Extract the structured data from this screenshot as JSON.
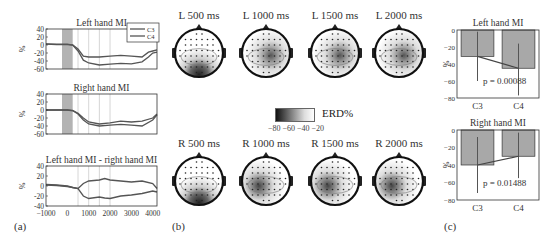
{
  "panel_labels": {
    "a": "(a)",
    "b": "(b)",
    "c": "(c)"
  },
  "colors": {
    "axis": "#333333",
    "line": "#555555",
    "bar": "#a8a8a8",
    "shade": "#9a9a9a",
    "grid": "#cccccc"
  },
  "chart_data": [
    {
      "id": "a1",
      "type": "line",
      "title": "Left hand MI",
      "xlabel": "",
      "ylabel": "%",
      "xlim": [
        -1000,
        4200
      ],
      "ylim": [
        -60,
        40
      ],
      "yticks": [
        40,
        20,
        0,
        -20,
        -40,
        -60
      ],
      "xticks": [
        -1000,
        0,
        1000,
        2000,
        3000,
        4000
      ],
      "shaded_region": [
        -250,
        250
      ],
      "vlines": [
        500,
        1000,
        1500,
        2000
      ],
      "legend": [
        "C3",
        "C4"
      ],
      "legend_position": "upper right",
      "series": [
        {
          "name": "C3",
          "x": [
            -1000,
            -500,
            0,
            250,
            500,
            750,
            1000,
            1500,
            2000,
            2500,
            3000,
            3500,
            3800,
            4000,
            4200
          ],
          "values": [
            2,
            1,
            1,
            0,
            -10,
            -28,
            -30,
            -30,
            -28,
            -26,
            -28,
            -30,
            -18,
            -15,
            -12
          ]
        },
        {
          "name": "C4",
          "x": [
            -1000,
            -500,
            0,
            250,
            500,
            750,
            1000,
            1500,
            2000,
            2500,
            3000,
            3500,
            3800,
            4000,
            4200
          ],
          "values": [
            3,
            2,
            2,
            0,
            -15,
            -38,
            -45,
            -50,
            -48,
            -46,
            -47,
            -42,
            -30,
            -20,
            -18
          ]
        }
      ]
    },
    {
      "id": "a2",
      "type": "line",
      "title": "Right hand MI",
      "xlabel": "",
      "ylabel": "%",
      "xlim": [
        -1000,
        4200
      ],
      "ylim": [
        -60,
        40
      ],
      "yticks": [
        40,
        20,
        0,
        -20,
        -40,
        -60
      ],
      "shaded_region": [
        -250,
        250
      ],
      "vlines": [
        500,
        1000,
        1500,
        2000
      ],
      "series": [
        {
          "name": "C3",
          "x": [
            -1000,
            -500,
            0,
            250,
            500,
            750,
            1000,
            1500,
            2000,
            2500,
            3000,
            3500,
            4000,
            4200
          ],
          "values": [
            0,
            0,
            0,
            -2,
            -10,
            -25,
            -35,
            -40,
            -38,
            -36,
            -38,
            -40,
            -25,
            -12
          ]
        },
        {
          "name": "C4",
          "x": [
            -1000,
            -500,
            0,
            250,
            500,
            750,
            1000,
            1500,
            2000,
            2500,
            3000,
            3500,
            4000,
            4200
          ],
          "values": [
            0,
            0,
            0,
            -1,
            -8,
            -20,
            -30,
            -35,
            -32,
            -28,
            -30,
            -28,
            -20,
            -10
          ]
        }
      ]
    },
    {
      "id": "a3",
      "type": "line",
      "title": "Left hand MI - right hand MI",
      "xlabel": "",
      "ylabel": "%",
      "xlim": [
        -1000,
        4200
      ],
      "ylim": [
        -40,
        40
      ],
      "yticks": [
        40,
        20,
        0,
        -20,
        -40
      ],
      "xticks": [
        -1000,
        0,
        1000,
        2000,
        3000,
        4000
      ],
      "vlines": [
        500,
        1000,
        1500,
        2000
      ],
      "series": [
        {
          "name": "C3",
          "x": [
            -1000,
            -500,
            0,
            250,
            500,
            750,
            1000,
            1500,
            1750,
            2000,
            2500,
            3000,
            3500,
            4000,
            4200
          ],
          "values": [
            3,
            2,
            0,
            -3,
            -5,
            5,
            10,
            12,
            15,
            12,
            10,
            8,
            10,
            5,
            -5
          ]
        },
        {
          "name": "C4",
          "x": [
            -1000,
            -500,
            0,
            250,
            500,
            750,
            1000,
            1500,
            1750,
            2000,
            2500,
            3000,
            3500,
            4000,
            4200
          ],
          "values": [
            2,
            1,
            -1,
            -3,
            -5,
            -20,
            -25,
            -22,
            -24,
            -25,
            -20,
            -18,
            -15,
            -10,
            -12
          ]
        }
      ]
    },
    {
      "id": "c1",
      "type": "bar",
      "title": "Left hand MI",
      "ylabel": "%",
      "categories": [
        "C3",
        "C4"
      ],
      "values": [
        -31,
        -45
      ],
      "error_low": [
        -60,
        -77
      ],
      "error_high": [
        -2,
        -16
      ],
      "ylim": [
        -80,
        0
      ],
      "yticks": [
        0,
        -20,
        -40,
        -60,
        -80
      ],
      "annotation": "p = 0.00088"
    },
    {
      "id": "c2",
      "type": "bar",
      "title": "Right hand MI",
      "ylabel": "%",
      "categories": [
        "C3",
        "C4"
      ],
      "values": [
        -40,
        -30
      ],
      "error_low": [
        -72,
        -55
      ],
      "error_high": [
        -8,
        -3
      ],
      "ylim": [
        -80,
        0
      ],
      "yticks": [
        0,
        -20,
        -40,
        -60,
        -80
      ],
      "annotation": "p = 0.01488"
    }
  ],
  "topomaps": {
    "left": [
      {
        "label": "L 500 ms"
      },
      {
        "label": "L 1000 ms"
      },
      {
        "label": "L 1500 ms"
      },
      {
        "label": "L 2000 ms"
      }
    ],
    "right": [
      {
        "label": "R 500 ms"
      },
      {
        "label": "R 1000 ms"
      },
      {
        "label": "R 1500 ms"
      },
      {
        "label": "R 2000 ms"
      }
    ],
    "colorbar": {
      "label": "ERD%",
      "ticks": "−80 −60 −40 −20"
    }
  }
}
